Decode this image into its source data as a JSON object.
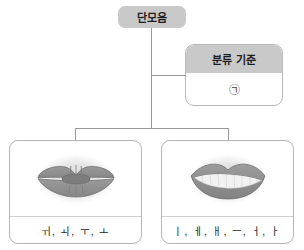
{
  "diagram": {
    "type": "tree",
    "root": {
      "label": "단모음"
    },
    "criterion": {
      "title": "분류 기준",
      "mark": "㉠",
      "mark_icon": "circled-giyeok-icon"
    },
    "branches": [
      {
        "id": "rounded",
        "figure_icon": "rounded-lips-icon",
        "figure_description": "원순 입모양 (둥근 입술)",
        "vowels": "ㅟ, ㅚ, ㅜ, ㅗ"
      },
      {
        "id": "unrounded",
        "figure_icon": "spread-lips-icon",
        "figure_description": "평순 입모양 (평평한 입술)",
        "vowels": "ㅣ, ㅔ, ㅐ, ㅡ, ㅓ, ㅏ"
      }
    ]
  },
  "colors": {
    "node_fill": "#c9c9c9",
    "card_border": "#b9b9b9",
    "line": "#9a9a9a",
    "lip_fill": "#8f8f8f",
    "lip_shadow": "#e6e6e6",
    "text": "#1d1d1d"
  }
}
